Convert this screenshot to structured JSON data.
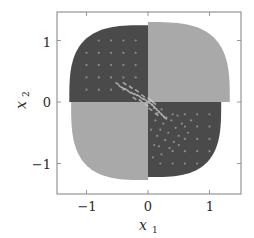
{
  "chart_data": {
    "type": "scatter",
    "title": "",
    "xlabel": "x_1",
    "ylabel": "x_2",
    "xlim": [
      -1.5,
      1.5
    ],
    "ylim": [
      -1.5,
      1.5
    ],
    "xticks": [
      -1,
      0,
      1
    ],
    "yticks": [
      -1,
      0,
      1
    ],
    "xtick_labels": [
      "−1",
      "0",
      "1"
    ],
    "ytick_labels": [
      "−1",
      "0",
      "1"
    ],
    "grid": false,
    "legend": null,
    "regions": [
      {
        "name": "upper-left",
        "quadrant": "II",
        "shade": "dark",
        "color": "#4a4a4a",
        "x_extent": [
          -1.28,
          0
        ],
        "y_extent": [
          0,
          1.25
        ]
      },
      {
        "name": "upper-right",
        "quadrant": "I",
        "shade": "light",
        "color": "#a9a9a9",
        "x_extent": [
          0,
          1.33
        ],
        "y_extent": [
          0,
          1.3
        ]
      },
      {
        "name": "lower-right",
        "quadrant": "IV",
        "shade": "dark",
        "color": "#4a4a4a",
        "x_extent": [
          0,
          1.19
        ],
        "y_extent": [
          -1.22,
          0
        ]
      },
      {
        "name": "lower-left",
        "quadrant": "III",
        "shade": "light",
        "color": "#a9a9a9",
        "x_extent": [
          -1.25,
          0
        ],
        "y_extent": [
          -1.27,
          0
        ]
      }
    ],
    "series": [
      {
        "name": "grid-points-upper-left",
        "color": "#8c8c8c",
        "points": [
          [
            -0.8,
            1.0
          ],
          [
            -0.6,
            1.0
          ],
          [
            -0.4,
            1.0
          ],
          [
            -0.2,
            1.0
          ],
          [
            -1.0,
            0.8
          ],
          [
            -0.8,
            0.8
          ],
          [
            -0.6,
            0.8
          ],
          [
            -0.4,
            0.8
          ],
          [
            -0.2,
            0.8
          ],
          [
            -1.0,
            0.6
          ],
          [
            -0.8,
            0.6
          ],
          [
            -0.6,
            0.6
          ],
          [
            -0.4,
            0.6
          ],
          [
            -0.2,
            0.6
          ],
          [
            -1.0,
            0.4
          ],
          [
            -0.8,
            0.4
          ],
          [
            -0.6,
            0.4
          ],
          [
            -0.4,
            0.4
          ],
          [
            -0.2,
            0.4
          ],
          [
            -1.0,
            0.2
          ],
          [
            -0.8,
            0.2
          ],
          [
            -0.6,
            0.2
          ],
          [
            -0.4,
            0.2
          ]
        ]
      },
      {
        "name": "grid-points-lower-right",
        "color": "#8c8c8c",
        "points": [
          [
            0.4,
            -0.2
          ],
          [
            0.6,
            -0.2
          ],
          [
            0.8,
            -0.2
          ],
          [
            1.0,
            -0.2
          ],
          [
            0.6,
            -0.4
          ],
          [
            0.8,
            -0.4
          ],
          [
            1.0,
            -0.4
          ],
          [
            0.6,
            -0.6
          ],
          [
            0.8,
            -0.6
          ],
          [
            1.0,
            -0.6
          ],
          [
            0.4,
            -0.8
          ],
          [
            0.6,
            -0.8
          ],
          [
            0.8,
            -0.8
          ],
          [
            1.0,
            -0.8
          ],
          [
            0.2,
            -1.0
          ],
          [
            0.4,
            -1.0
          ],
          [
            0.6,
            -1.0
          ],
          [
            0.8,
            -1.0
          ]
        ]
      },
      {
        "name": "scattered-points-lower-right",
        "color": "#8c8c8c",
        "points": [
          [
            0.1,
            -0.1
          ],
          [
            0.15,
            -0.18
          ],
          [
            0.22,
            -0.12
          ],
          [
            0.3,
            -0.25
          ],
          [
            0.12,
            -0.3
          ],
          [
            0.25,
            -0.35
          ],
          [
            0.38,
            -0.3
          ],
          [
            0.45,
            -0.42
          ],
          [
            0.2,
            -0.45
          ],
          [
            0.33,
            -0.5
          ],
          [
            0.5,
            -0.55
          ],
          [
            0.15,
            -0.55
          ],
          [
            0.28,
            -0.62
          ],
          [
            0.42,
            -0.65
          ],
          [
            0.55,
            -0.35
          ],
          [
            0.1,
            -0.7
          ],
          [
            0.35,
            -0.75
          ],
          [
            0.5,
            -0.7
          ],
          [
            0.22,
            -0.85
          ],
          [
            0.08,
            -0.9
          ],
          [
            0.65,
            -0.5
          ],
          [
            0.7,
            -0.3
          ],
          [
            0.48,
            -0.22
          ],
          [
            0.05,
            -0.45
          ],
          [
            0.18,
            -0.72
          ]
        ]
      },
      {
        "name": "center-streak-points",
        "color": "#c8c8c8",
        "points": [
          [
            -0.5,
            0.3
          ],
          [
            -0.45,
            0.25
          ],
          [
            -0.4,
            0.22
          ],
          [
            -0.35,
            0.2
          ],
          [
            -0.3,
            0.16
          ],
          [
            -0.25,
            0.14
          ],
          [
            -0.2,
            0.12
          ],
          [
            -0.15,
            0.1
          ],
          [
            -0.1,
            0.06
          ],
          [
            -0.05,
            0.04
          ],
          [
            0.0,
            0.0
          ],
          [
            0.05,
            -0.03
          ],
          [
            0.08,
            -0.06
          ],
          [
            0.12,
            -0.1
          ],
          [
            0.16,
            -0.14
          ],
          [
            0.2,
            -0.18
          ],
          [
            0.24,
            -0.22
          ],
          [
            0.28,
            -0.26
          ],
          [
            -0.38,
            0.3
          ],
          [
            -0.28,
            0.24
          ],
          [
            -0.18,
            0.18
          ],
          [
            -0.08,
            0.1
          ],
          [
            0.02,
            0.05
          ],
          [
            0.06,
            0.02
          ],
          [
            -0.12,
            0.02
          ],
          [
            -0.22,
            0.06
          ],
          [
            0.1,
            -0.02
          ],
          [
            0.14,
            -0.2
          ],
          [
            0.04,
            -0.12
          ],
          [
            -0.02,
            -0.05
          ]
        ]
      }
    ]
  }
}
